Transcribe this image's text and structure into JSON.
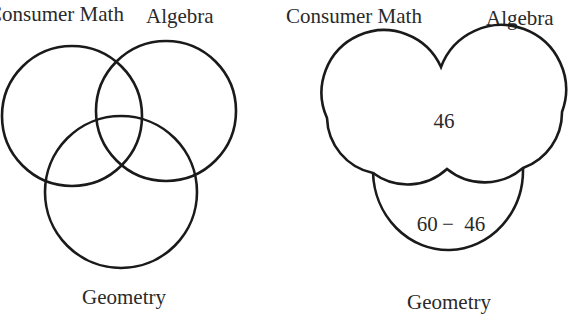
{
  "diagrams": [
    {
      "id": "left",
      "type": "three-set venn",
      "sets": [
        {
          "name": "Consumer Math",
          "label": "Consumer Math",
          "cx": 72,
          "cy": 116,
          "r": 70
        },
        {
          "name": "Algebra",
          "label": "Algebra",
          "cx": 166,
          "cy": 111,
          "r": 70
        },
        {
          "name": "Geometry",
          "label": "Geometry",
          "cx": 121,
          "cy": 192,
          "r": 76
        }
      ],
      "labels": {
        "consumer_math": "Consumer Math",
        "algebra": "Algebra",
        "geometry": "Geometry"
      }
    },
    {
      "id": "right",
      "type": "merged-region venn",
      "labels": {
        "consumer_math": "Consumer Math",
        "algebra": "Algebra",
        "geometry": "Geometry"
      },
      "regions": {
        "union_consumer_algebra": "46",
        "geometry_only": "60 −  46"
      }
    }
  ],
  "colors": {
    "stroke": "#1a1a1a",
    "text": "#2a2a2a",
    "background": "#ffffff"
  }
}
